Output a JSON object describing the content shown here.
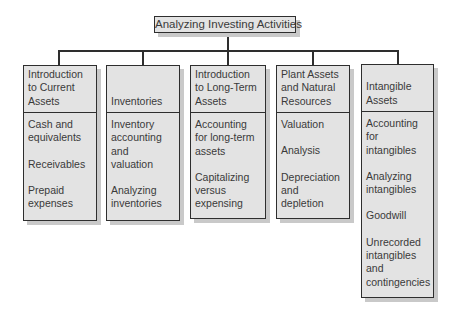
{
  "diagram": {
    "title": "Analyzing Investing Activities",
    "columns": [
      {
        "heading": "Introduction\nto Current\nAssets",
        "items": [
          "Cash and\nequivalents",
          "Receivables",
          "Prepaid\nexpenses"
        ]
      },
      {
        "heading": "Inventories",
        "items": [
          "Inventory\naccounting\nand\nvaluation",
          "Analyzing\ninventories"
        ]
      },
      {
        "heading": "Introduction\nto Long-Term\nAssets",
        "items": [
          "Accounting\nfor long-term\nassets",
          "Capitalizing\nversus\nexpensing"
        ]
      },
      {
        "heading": "Plant Assets\nand Natural\nResources",
        "items": [
          "Valuation",
          "Analysis",
          "Depreciation\nand\ndepletion"
        ]
      },
      {
        "heading": "Intangible\nAssets",
        "items": [
          "Accounting\nfor\nintangibles",
          "Analyzing\nintangibles",
          "Goodwill",
          "Unrecorded\nintangibles\nand\ncontingencies"
        ]
      }
    ]
  }
}
